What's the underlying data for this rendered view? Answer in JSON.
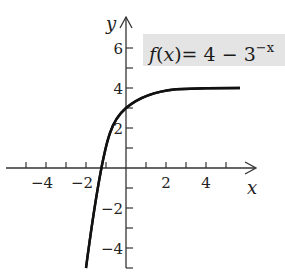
{
  "chart_data": {
    "type": "line",
    "title": "",
    "annotation": "f(x)= 4 − 3^(−x)",
    "function": "4 - 3^(-x)",
    "xlabel": "x",
    "ylabel": "y",
    "xlim": [
      -5.5,
      6.5
    ],
    "ylim": [
      -5,
      7.5
    ],
    "x_ticks": [
      -5,
      -4,
      -3,
      -2,
      -1,
      1,
      2,
      3,
      4,
      5
    ],
    "x_tick_labels": [
      "-4",
      "-2",
      "2",
      "4"
    ],
    "y_ticks": [
      -5,
      -4,
      -3,
      -2,
      -1,
      1,
      2,
      3,
      4,
      5,
      6
    ],
    "y_tick_labels": [
      "6",
      "4",
      "2",
      "-2",
      "-4"
    ],
    "grid": false,
    "legend": "none",
    "series": [
      {
        "name": "f(x)",
        "x": [
          -2,
          -1.5,
          -1,
          -0.5,
          0,
          0.5,
          1,
          1.5,
          2,
          3,
          4,
          5
        ],
        "values": [
          -5,
          -1.2,
          1,
          2.27,
          3,
          3.42,
          3.67,
          3.81,
          3.89,
          3.96,
          3.99,
          4.0
        ]
      }
    ]
  },
  "labels": {
    "x_axis": "x",
    "y_axis": "y",
    "formula_f": "f",
    "formula_x": "(x)",
    "formula_rest": "= 4 − 3",
    "formula_exp": "−x",
    "xt_m4": "−4",
    "xt_m2": "−2",
    "xt_2": "2",
    "xt_4": "4",
    "yt_6": "6",
    "yt_4": "4",
    "yt_2": "2",
    "yt_m2": "−2",
    "yt_m4": "−4"
  }
}
